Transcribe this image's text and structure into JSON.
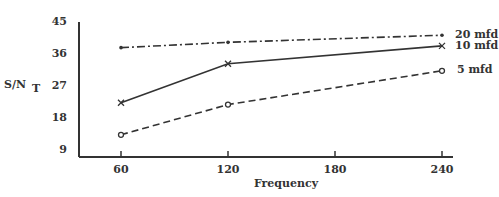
{
  "chart_data": {
    "type": "line",
    "title": "",
    "xlabel": "Frequency",
    "ylabel": "S/N_T",
    "ylabel_main": "S/N",
    "ylabel_sub": "T",
    "x": [
      60,
      120,
      240
    ],
    "x_ticks": [
      "60",
      "120",
      "180",
      "240"
    ],
    "y_ticks": [
      "45",
      "36",
      "27",
      "18",
      "9"
    ],
    "ylim": [
      7,
      45
    ],
    "xlim": [
      35,
      250
    ],
    "grid": false,
    "legend_position": "inline-right",
    "series": [
      {
        "name": "20 mfd",
        "values": [
          37.5,
          39,
          41
        ],
        "style": "dash-dot",
        "marker": "dot"
      },
      {
        "name": "10 mfd",
        "values": [
          22,
          33,
          38
        ],
        "style": "solid",
        "marker": "x"
      },
      {
        "name": "5 mfd",
        "values": [
          13,
          21.5,
          31
        ],
        "style": "dashed",
        "marker": "o"
      }
    ]
  }
}
